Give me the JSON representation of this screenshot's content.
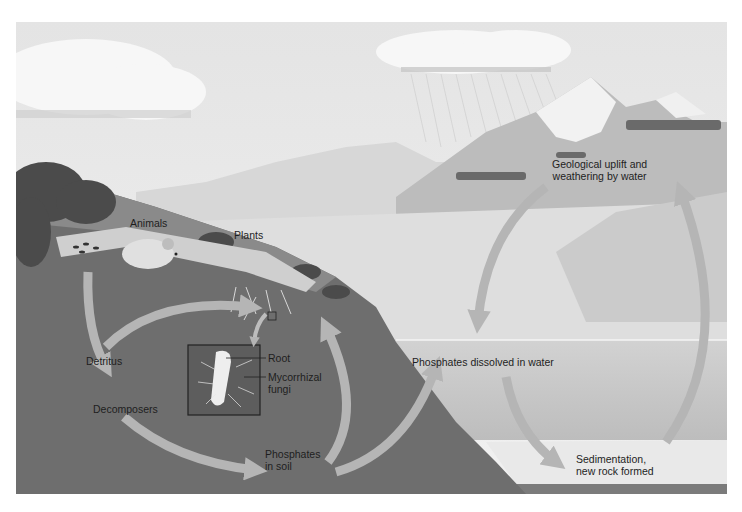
{
  "diagram": {
    "type": "phosphorus-cycle-illustration",
    "colors": {
      "sky": "#ececec",
      "soil": "#6e6e6e",
      "water": "#c9c9c9",
      "arrow": "#b5b5b5",
      "sediment": "#e6e6e6",
      "text": "#1e1e1e"
    },
    "labels": {
      "animals": "Animals",
      "plants": "Plants",
      "detritus": "Detritus",
      "decomposers": "Decomposers",
      "root": "Root",
      "mycorrhizal_fungi": "Mycorrhizal\nfungi",
      "phosphates_in_soil": "Phosphates\nin soil",
      "phosphates_dissolved": "Phosphates dissolved in water",
      "geological_uplift": "Geological uplift and\nweathering by water",
      "sedimentation": "Sedimentation,\nnew rock formed"
    },
    "icons": [
      "mouse-illustration",
      "plant-illustration",
      "root-inset",
      "mountain-illustration",
      "rain-cloud",
      "cycle-arrow"
    ]
  }
}
